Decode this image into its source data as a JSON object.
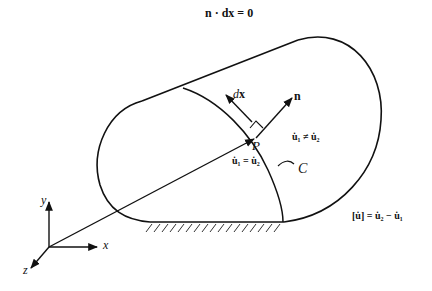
{
  "diagram": {
    "title_equation": "n · dx = 0",
    "labels": {
      "dx": "dx",
      "n": "n",
      "P": "P",
      "C": "C",
      "region_continuous": "u̇₁ = u̇₂",
      "region_discontinuous": "u̇₁ ≠ u̇₂",
      "jump": "[u̇] = u̇₂ − u̇₁",
      "axis_x": "x",
      "axis_y": "y",
      "axis_z": "z"
    },
    "colors": {
      "stroke": "#111111",
      "background": "#ffffff",
      "hatch": "#333333"
    }
  }
}
